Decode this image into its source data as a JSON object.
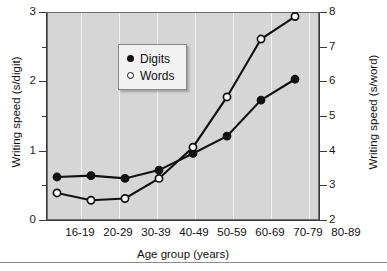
{
  "chart_data": {
    "type": "line",
    "title": "",
    "xlabel": "Age group (years)",
    "ylabel": "Writing speed (s/digit)",
    "ylabel_right": "Writing speed (s/word)",
    "categories": [
      "16-19",
      "20-29",
      "30-39",
      "40-49",
      "50-59",
      "60-69",
      "70-79",
      "80-89"
    ],
    "ylim": [
      0,
      3
    ],
    "ylim_right": [
      2,
      8
    ],
    "yticks": [
      0,
      1,
      2,
      3
    ],
    "yticks_right": [
      2,
      3,
      4,
      5,
      6,
      7,
      8
    ],
    "yminorticks": [
      0.5,
      1.5,
      2.5
    ],
    "grid": "vertical",
    "legend_position": "upper-left-inside",
    "plot_background": "#d6d6d6",
    "series": [
      {
        "name": "Digits",
        "axis": "left",
        "units": "s/digit",
        "marker": "filled-circle",
        "color": "#111111",
        "values": [
          0.62,
          0.64,
          0.6,
          0.72,
          0.96,
          1.21,
          1.73,
          2.03
        ]
      },
      {
        "name": "Words",
        "axis": "right",
        "units": "s/word",
        "marker": "open-circle",
        "color": "#111111",
        "values": [
          2.78,
          2.57,
          2.62,
          3.2,
          4.1,
          5.55,
          7.22,
          7.87
        ]
      }
    ]
  },
  "axis": {
    "left_title": "Writing speed (s/digit)",
    "right_title": "Writing speed (s/word)",
    "x_title": "Age group (years)",
    "left_tick_labels": [
      "3",
      "2",
      "1",
      "0"
    ],
    "right_tick_labels": [
      "8",
      "7",
      "6",
      "5",
      "4",
      "3",
      "2"
    ],
    "x_tick_labels": [
      "16-19",
      "20-29",
      "30-39",
      "40-49",
      "50-59",
      "60-69",
      "70-79",
      "80-89"
    ]
  },
  "legend": {
    "items": [
      {
        "label": "Digits",
        "marker": "filled-circle"
      },
      {
        "label": "Words",
        "marker": "open-circle"
      }
    ]
  }
}
